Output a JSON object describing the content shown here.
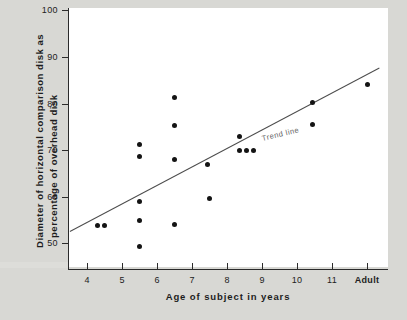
{
  "chart_data": {
    "type": "scatter",
    "title": "",
    "xlabel": "Age of subject in years",
    "ylabel": "Diameter of horizontal comparison disk as percentage of overhead disk",
    "ylabel_lines": [
      "Diameter of horizontal comparison disk as",
      "percentage of overhead disk"
    ],
    "xticks": [
      "4",
      "5",
      "6",
      "7",
      "8",
      "9",
      "10",
      "11",
      "Adult"
    ],
    "xtick_values": [
      4,
      5,
      6,
      7,
      8,
      9,
      10,
      11,
      12
    ],
    "yticks": [
      "100",
      "90",
      "80",
      "70",
      "60",
      "50"
    ],
    "ytick_values": [
      100,
      90,
      80,
      70,
      60,
      50
    ],
    "xlim": [
      3.45,
      12.6
    ],
    "ylim": [
      44.5,
      100.5
    ],
    "grid": false,
    "legend": false,
    "annotations": [
      {
        "text": "Trend line",
        "x": 9.0,
        "y": 73.5,
        "rotation": -13.5
      }
    ],
    "series": [
      {
        "name": "subjects",
        "marker": "filled-circle",
        "color": "#141414",
        "points": [
          {
            "x": 4.3,
            "y": 53.8
          },
          {
            "x": 4.5,
            "y": 53.8
          },
          {
            "x": 5.5,
            "y": 71.2
          },
          {
            "x": 5.5,
            "y": 68.6
          },
          {
            "x": 5.5,
            "y": 59.0
          },
          {
            "x": 5.5,
            "y": 55.0
          },
          {
            "x": 5.5,
            "y": 49.4
          },
          {
            "x": 6.5,
            "y": 81.2
          },
          {
            "x": 6.5,
            "y": 75.2
          },
          {
            "x": 6.5,
            "y": 68.0
          },
          {
            "x": 6.5,
            "y": 54.0
          },
          {
            "x": 7.45,
            "y": 67.0
          },
          {
            "x": 7.5,
            "y": 59.6
          },
          {
            "x": 8.35,
            "y": 73.0
          },
          {
            "x": 8.35,
            "y": 70.0
          },
          {
            "x": 8.55,
            "y": 70.0
          },
          {
            "x": 8.75,
            "y": 70.0
          },
          {
            "x": 10.45,
            "y": 80.2
          },
          {
            "x": 10.45,
            "y": 75.4
          },
          {
            "x": 12.0,
            "y": 84.0
          }
        ]
      }
    ],
    "trend_line": {
      "name": "Trend line",
      "color": "#4d4d4d",
      "x_start": 3.5,
      "y_start": 52.7,
      "x_end": 12.35,
      "y_end": 87.8
    }
  },
  "colors": {
    "background": "#d8d8d4",
    "plot_background": "#ffffff",
    "axis": "#2b2b2b",
    "marker": "#141414",
    "trend": "#4d4d4d",
    "annotation": "#636363"
  }
}
